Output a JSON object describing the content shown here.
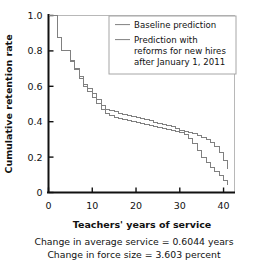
{
  "chart_data": {
    "type": "line",
    "title": "",
    "xlabel": "Teachers' years of service",
    "ylabel": "Cumulative retention rate",
    "xlim": [
      0,
      42.5
    ],
    "ylim": [
      0,
      1.0
    ],
    "grid": false,
    "step_style": "post",
    "xticks": [
      0,
      10,
      20,
      30,
      40
    ],
    "xtick_labels": [
      "0",
      "10",
      "20",
      "30",
      "40"
    ],
    "yticks": [
      0,
      0.2,
      0.4,
      0.6,
      0.8,
      1.0
    ],
    "ytick_labels": [
      "0",
      "0.2",
      "0.4",
      "0.6",
      "0.8",
      "1.0"
    ],
    "legend_position": "top-right",
    "series": [
      {
        "name": "Baseline prediction",
        "color": "#808080",
        "x": [
          0,
          1,
          2,
          3,
          4,
          5,
          6,
          7,
          8,
          9,
          10,
          11,
          12,
          13,
          14,
          15,
          16,
          17,
          18,
          19,
          20,
          21,
          22,
          23,
          24,
          25,
          26,
          27,
          28,
          29,
          30,
          31,
          32,
          33,
          34,
          35,
          36,
          37,
          38,
          39,
          40,
          41
        ],
        "values": [
          1.0,
          1.0,
          0.875,
          0.8,
          0.8,
          0.748,
          0.703,
          0.657,
          0.612,
          0.588,
          0.558,
          0.523,
          0.492,
          0.471,
          0.462,
          0.455,
          0.448,
          0.441,
          0.434,
          0.428,
          0.422,
          0.416,
          0.41,
          0.404,
          0.398,
          0.392,
          0.386,
          0.379,
          0.371,
          0.362,
          0.352,
          0.345,
          0.338,
          0.331,
          0.322,
          0.312,
          0.298,
          0.281,
          0.258,
          0.228,
          0.183,
          0.132
        ]
      },
      {
        "name": "Prediction with reforms for new hires after January 1, 2011",
        "color": "#808080",
        "x": [
          0,
          1,
          2,
          3,
          4,
          5,
          6,
          7,
          8,
          9,
          10,
          11,
          12,
          13,
          14,
          15,
          16,
          17,
          18,
          19,
          20,
          21,
          22,
          23,
          24,
          25,
          26,
          27,
          28,
          29,
          30,
          31,
          32,
          33,
          34,
          35,
          36,
          37,
          38,
          39,
          40,
          41
        ],
        "values": [
          1.0,
          1.0,
          0.875,
          0.8,
          0.8,
          0.742,
          0.694,
          0.645,
          0.598,
          0.572,
          0.539,
          0.502,
          0.468,
          0.444,
          0.433,
          0.425,
          0.418,
          0.411,
          0.405,
          0.399,
          0.393,
          0.388,
          0.383,
          0.378,
          0.373,
          0.368,
          0.363,
          0.358,
          0.353,
          0.347,
          0.34,
          0.326,
          0.305,
          0.275,
          0.236,
          0.198,
          0.168,
          0.142,
          0.118,
          0.094,
          0.068,
          0.042
        ]
      }
    ],
    "annotations": [
      "Change in average service = 0.6044 years",
      "Change in force size = 3.603 percent"
    ]
  },
  "legend": {
    "entries": [
      {
        "label": "Baseline prediction",
        "lines": [
          "Baseline prediction"
        ]
      },
      {
        "label": "Prediction with reforms for new hires after January 1, 2011",
        "lines": [
          "Prediction with",
          "reforms for new hires",
          "after January 1, 2011"
        ]
      }
    ]
  },
  "colors": {
    "axis": "#111111",
    "curve": "#808080",
    "frame": "#b8b8b8",
    "text": "#111111",
    "background": "#ffffff"
  }
}
